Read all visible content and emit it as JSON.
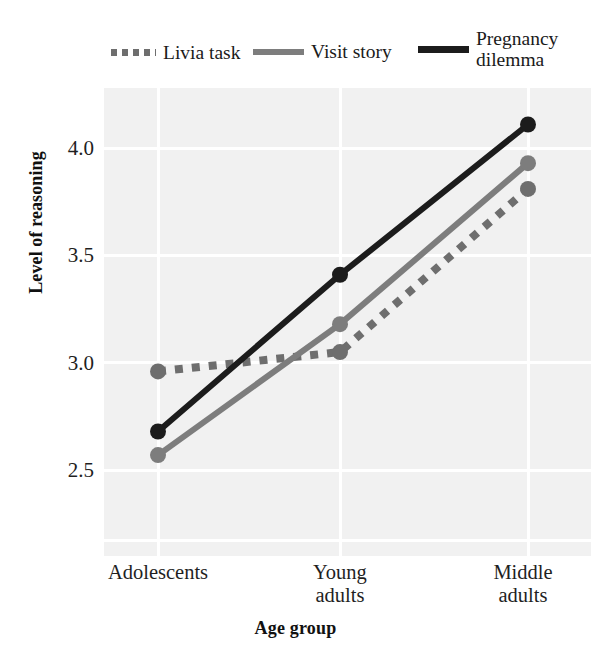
{
  "chart_data": {
    "type": "line",
    "title": "",
    "xlabel": "Age group",
    "ylabel": "Level of reasoning",
    "categories": [
      "Adolescents",
      "Young adults",
      "Middle adults"
    ],
    "category_lines": [
      [
        "Adolescents"
      ],
      [
        "Young",
        "adults"
      ],
      [
        "Middle",
        "adults"
      ]
    ],
    "yticks": [
      "4.0",
      "3.5",
      "3.0",
      "2.5"
    ],
    "ytick_values": [
      4.0,
      3.5,
      3.0,
      2.5
    ],
    "ylim": [
      2.1,
      4.28
    ],
    "grid": true,
    "grid_color": "#ffffff",
    "panel_background": "#f1f1f1",
    "legend_position": "top",
    "series": [
      {
        "name": "Livia task",
        "values": [
          2.96,
          3.05,
          3.81
        ],
        "style": "dotted",
        "color": "#6e6e6e",
        "marker": "circle"
      },
      {
        "name": "Visit story",
        "values": [
          2.57,
          3.18,
          3.93
        ],
        "style": "solid",
        "color": "#7d7d7d",
        "marker": "circle"
      },
      {
        "name": "Pregnancy dilemma",
        "values": [
          2.68,
          3.41,
          4.11
        ],
        "style": "solid",
        "color": "#1c1c1c",
        "marker": "circle"
      }
    ]
  },
  "legend": {
    "items": [
      {
        "label": "Livia task",
        "swatch": "dotted-gray-line-swatch"
      },
      {
        "label": "Visit story",
        "swatch": "solid-gray-line-swatch"
      },
      {
        "label": "Pregnancy dilemma",
        "swatch": "solid-black-line-swatch"
      }
    ]
  },
  "axes": {
    "y_title": "Level of reasoning",
    "x_title": "Age group",
    "y_ticks": [
      "4.0",
      "3.5",
      "3.0",
      "2.5"
    ],
    "x_ticks": [
      "Adolescents",
      "Young adults",
      "Middle adults"
    ]
  }
}
